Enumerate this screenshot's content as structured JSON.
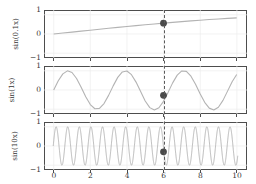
{
  "figure": {
    "background": "#ffffff",
    "frame_color": "#4d4d4d",
    "curve_color": "#b0b0b0",
    "marker_color": "#4a4a4a",
    "vline_color": "#5a5a5a",
    "grid_color": "#e8e8e8"
  },
  "axis": {
    "xticks": [
      "0",
      "2",
      "4",
      "6",
      "8",
      "10"
    ],
    "xtick_values": [
      0,
      2,
      4,
      6,
      8,
      10
    ],
    "yticks": [
      "1",
      "0",
      "−1"
    ],
    "ytick_values": [
      1,
      0,
      -1
    ],
    "xlim": [
      -0.5,
      10.5
    ],
    "ylim": [
      -1.25,
      1.25
    ],
    "xlabel": "",
    "minor_xticks": [
      1,
      3,
      5,
      7,
      9
    ]
  },
  "panels": [
    {
      "ylabel": "sin(0.1x)",
      "freq": 0.1,
      "marker_x": 6,
      "marker_y": 0.565
    },
    {
      "ylabel": "sin(1x)",
      "freq": 1,
      "marker_x": 6,
      "marker_y": -0.279
    },
    {
      "ylabel": "sin(10x)",
      "freq": 10,
      "marker_x": 6,
      "marker_y": -0.305
    }
  ],
  "marker": {
    "x": 6,
    "style": "filled-circle",
    "radius": 3.4
  },
  "chart_data": {
    "type": "line",
    "title": "",
    "xlabel": "",
    "ylabel": "",
    "xlim": [
      -0.5,
      10.5
    ],
    "ylim": [
      -1.25,
      1.25
    ],
    "grid": true,
    "legend": "none",
    "subplots": [
      {
        "ylabel": "sin(0.1x)",
        "function": "sin(0.1*x)",
        "x": [
          0,
          0.5,
          1,
          1.5,
          2,
          2.5,
          3,
          3.5,
          4,
          4.5,
          5,
          5.5,
          6,
          6.5,
          7,
          7.5,
          8,
          8.5,
          9,
          9.5,
          10
        ],
        "y": [
          0.0,
          0.0499,
          0.0998,
          0.1494,
          0.1987,
          0.2474,
          0.2955,
          0.3429,
          0.3894,
          0.435,
          0.4794,
          0.5227,
          0.5646,
          0.6052,
          0.6442,
          0.6816,
          0.7174,
          0.7513,
          0.7833,
          0.8134,
          0.8415
        ],
        "marker": {
          "x": 6,
          "y": 0.5646
        },
        "yticks": [
          1,
          0,
          -1
        ]
      },
      {
        "ylabel": "sin(1x)",
        "function": "sin(1*x)",
        "x": [
          0,
          0.5,
          1,
          1.5,
          2,
          2.5,
          3,
          3.5,
          4,
          4.5,
          5,
          5.5,
          6,
          6.5,
          7,
          7.5,
          8,
          8.5,
          9,
          9.5,
          10
        ],
        "y": [
          0.0,
          0.4794,
          0.8415,
          0.9975,
          0.9093,
          0.5985,
          0.1411,
          -0.3508,
          -0.7568,
          -0.9775,
          -0.9589,
          -0.7055,
          -0.2794,
          0.2151,
          0.657,
          0.938,
          0.9894,
          0.7985,
          0.4121,
          -0.0752,
          -0.544
        ],
        "marker": {
          "x": 6,
          "y": -0.2794
        },
        "yticks": [
          1,
          0,
          -1
        ]
      },
      {
        "ylabel": "sin(10x)",
        "function": "sin(10*x)",
        "x_range": [
          0,
          10
        ],
        "period": 0.6283,
        "cycles": 15.9,
        "amplitude": 1,
        "marker": {
          "x": 6,
          "y": -0.3048
        },
        "yticks": [
          1,
          0,
          -1
        ]
      }
    ],
    "vertical_reference_line": {
      "x": 6,
      "style": "dashed",
      "spans_all_subplots": true
    },
    "xticks": [
      0,
      2,
      4,
      6,
      8,
      10
    ]
  }
}
